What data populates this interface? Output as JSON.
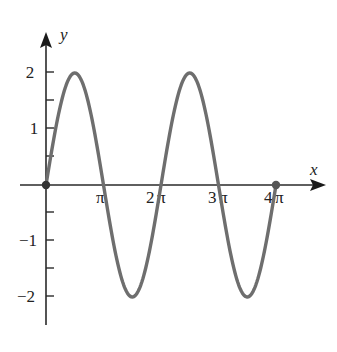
{
  "chart_data": {
    "type": "line",
    "title": "",
    "function": "y = 2 sin(x)",
    "xlabel": "x",
    "ylabel": "y",
    "x_ticks": [
      {
        "value": 3.14159,
        "label": "π"
      },
      {
        "value": 6.28319,
        "label": "2π"
      },
      {
        "value": 9.42478,
        "label": "3π"
      },
      {
        "value": 12.56637,
        "label": "4π"
      }
    ],
    "y_ticks": [
      {
        "value": 2,
        "label": "2"
      },
      {
        "value": 1,
        "label": "1"
      },
      {
        "value": -1,
        "label": "−1"
      },
      {
        "value": -2,
        "label": "−2"
      }
    ],
    "y_minor_ticks": [
      1.5,
      0.5,
      -0.5,
      -1.5
    ],
    "xlim": [
      0,
      12.566
    ],
    "ylim": [
      -2.5,
      2.5
    ],
    "grid": false,
    "series": [
      {
        "name": "2 sin x",
        "color": "#6e6e6e",
        "x": [
          0,
          1.5708,
          3.1416,
          4.7124,
          6.2832,
          7.854,
          9.4248,
          10.9956,
          12.5664
        ],
        "values": [
          0,
          2,
          0,
          -2,
          0,
          2,
          0,
          -2,
          0
        ]
      }
    ],
    "endpoints": [
      {
        "x": 0,
        "y": 0
      },
      {
        "x": 12.5664,
        "y": 0
      }
    ]
  },
  "labels": {
    "x_axis": "x",
    "y_axis": "y",
    "xt1": "π",
    "xt2_num": "2",
    "xt3_num": "3",
    "xt4_num": "4",
    "pi": "π",
    "yt2": "2",
    "yt1": "1",
    "ytm1": "−1",
    "ytm2": "−2"
  }
}
